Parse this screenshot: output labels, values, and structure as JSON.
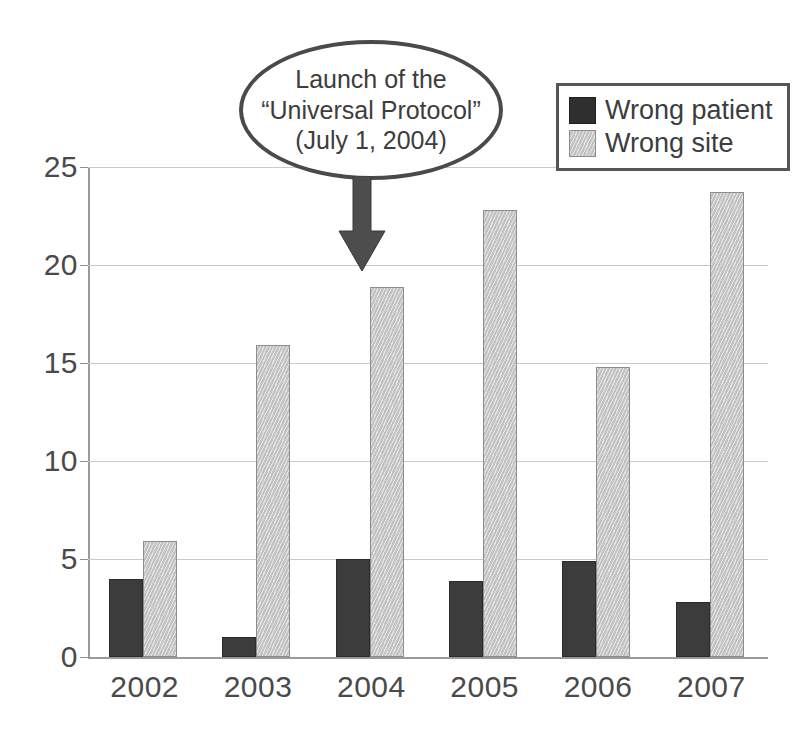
{
  "chart_data": {
    "type": "bar",
    "title": "",
    "xlabel": "",
    "ylabel": "",
    "categories": [
      "2002",
      "2003",
      "2004",
      "2005",
      "2006",
      "2007"
    ],
    "series": [
      {
        "name": "Wrong patient",
        "color": "#3c3c3c",
        "values": [
          4,
          1,
          5,
          3.9,
          4.9,
          2.8
        ]
      },
      {
        "name": "Wrong site",
        "color": "#c6c6c6",
        "values": [
          5.9,
          15.9,
          18.9,
          22.8,
          14.8,
          23.7
        ]
      }
    ],
    "ylim": [
      0,
      25
    ],
    "yticks": [
      0,
      5,
      10,
      15,
      20,
      25
    ],
    "ytick_labels": [
      "0",
      "5",
      "10",
      "15",
      "20",
      "25"
    ],
    "grid": true,
    "legend_position": "top-right",
    "annotations": [
      {
        "name": "universal-protocol-callout",
        "shape": "ellipse",
        "lines": [
          "Launch of the",
          "“Universal Protocol”",
          "(July 1, 2004)"
        ],
        "arrow": "down-arrow",
        "points_to": "2004"
      }
    ]
  },
  "legend": {
    "items": [
      {
        "label": "Wrong patient",
        "swatch": "dark"
      },
      {
        "label": "Wrong site",
        "swatch": "light"
      }
    ]
  },
  "axes": {
    "y_tick_labels": [
      "25",
      "20",
      "15",
      "10",
      "5",
      "0"
    ],
    "x_tick_labels": [
      "2002",
      "2003",
      "2004",
      "2005",
      "2006",
      "2007"
    ]
  },
  "annotation": {
    "line1": "Launch of the",
    "line2": "“Universal Protocol”",
    "line3": "(July 1, 2004)"
  },
  "colors": {
    "wrong_patient": "#3c3c3c",
    "wrong_site": "#c6c6c6",
    "axis": "#9a9a9a",
    "grid": "#c9c9c9",
    "text": "#3d3d3d"
  }
}
